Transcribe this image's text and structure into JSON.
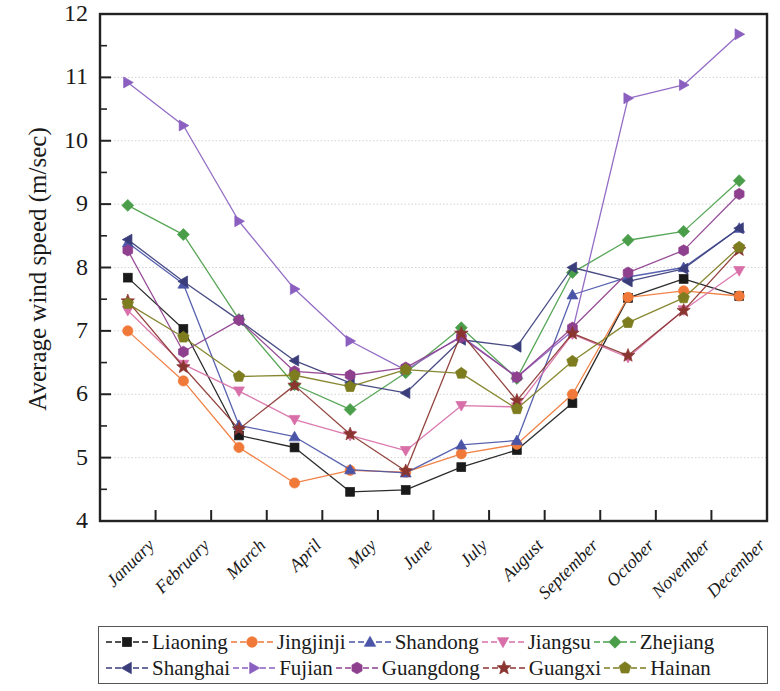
{
  "chart_data": {
    "type": "line",
    "title": "",
    "xlabel": "",
    "ylabel": "Average wind speed (m/sec)",
    "categories": [
      "January",
      "February",
      "March",
      "April",
      "May",
      "June",
      "July",
      "August",
      "September",
      "October",
      "November",
      "December"
    ],
    "ylim": [
      4,
      12
    ],
    "yticks": [
      4,
      5,
      6,
      7,
      8,
      9,
      10,
      11,
      12
    ],
    "yticklabels": [
      "4",
      "5",
      "6",
      "7",
      "8",
      "9",
      "10",
      "11",
      "12"
    ],
    "minor_ticks": true,
    "grid": true,
    "legend_position": "below-plot",
    "series": [
      {
        "name": "Liaoning",
        "color": "#1a1a1a",
        "marker": "square",
        "values": [
          7.84,
          7.03,
          5.35,
          5.16,
          4.46,
          4.49,
          4.85,
          5.12,
          5.86,
          7.52,
          7.82,
          7.55
        ]
      },
      {
        "name": "Jingjinji",
        "color": "#f07838",
        "marker": "circle",
        "values": [
          7.0,
          6.21,
          5.16,
          4.6,
          4.8,
          4.77,
          5.06,
          5.21,
          6.0,
          7.53,
          7.63,
          7.55
        ]
      },
      {
        "name": "Shandong",
        "color": "#4a55a8",
        "marker": "triangle-up",
        "values": [
          8.39,
          7.74,
          5.51,
          5.33,
          4.81,
          4.76,
          5.2,
          5.27,
          7.57,
          7.85,
          8.0,
          8.62
        ]
      },
      {
        "name": "Jiangsu",
        "color": "#d86fa8",
        "marker": "triangle-down",
        "values": [
          7.32,
          6.47,
          6.05,
          5.6,
          5.35,
          5.11,
          5.82,
          5.8,
          6.95,
          6.58,
          7.33,
          7.95
        ]
      },
      {
        "name": "Zhejiang",
        "color": "#4a9e4a",
        "marker": "diamond",
        "values": [
          8.98,
          8.52,
          7.18,
          6.15,
          5.76,
          6.34,
          7.05,
          6.25,
          7.92,
          8.43,
          8.57,
          9.37
        ]
      },
      {
        "name": "Shanghai",
        "color": "#3a3d7a",
        "marker": "triangle-left",
        "values": [
          8.44,
          7.78,
          7.17,
          6.53,
          6.18,
          6.02,
          6.86,
          6.75,
          8.0,
          7.78,
          7.98,
          8.62
        ]
      },
      {
        "name": "Fujian",
        "color": "#8a5fc0",
        "marker": "triangle-right",
        "values": [
          10.92,
          10.24,
          8.73,
          7.66,
          6.84,
          6.38,
          6.92,
          6.27,
          7.0,
          10.67,
          10.88,
          11.68
        ]
      },
      {
        "name": "Guangdong",
        "color": "#8e3f8e",
        "marker": "hexagon",
        "values": [
          8.27,
          6.67,
          7.17,
          6.36,
          6.3,
          6.42,
          6.9,
          6.27,
          7.05,
          7.92,
          8.27,
          9.16
        ]
      },
      {
        "name": "Guangxi",
        "color": "#8a3530",
        "marker": "star",
        "values": [
          7.47,
          6.43,
          5.45,
          6.14,
          5.37,
          4.79,
          6.96,
          5.9,
          6.96,
          6.61,
          7.32,
          8.28
        ]
      },
      {
        "name": "Hainan",
        "color": "#7d7d20",
        "marker": "pentagon",
        "values": [
          7.43,
          6.9,
          6.28,
          6.3,
          6.12,
          6.39,
          6.33,
          5.77,
          6.52,
          7.13,
          7.52,
          8.32
        ]
      }
    ]
  },
  "legend": {
    "row1": [
      "Liaoning",
      "Jingjinji",
      "Shandong",
      "Jiangsu",
      "Zhejiang"
    ],
    "row2": [
      "Shanghai",
      "Fujian",
      "Guangdong",
      "Guangxi",
      "Hainan"
    ]
  },
  "axes": {
    "frame_color": "#222222",
    "grid_color": "#c8c8c8"
  }
}
